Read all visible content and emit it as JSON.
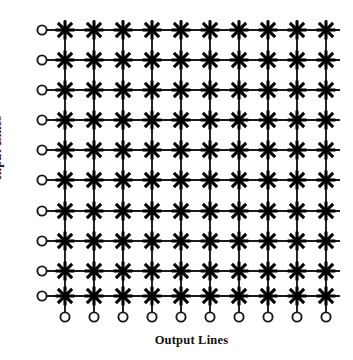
{
  "figure": {
    "type": "crossbar-switch-diagram",
    "input_label": "Input Lines",
    "output_label": "Output Lines",
    "caption_remnant": "",
    "colors": {
      "line": "#1a1a1a",
      "crosspoint": "#000000",
      "terminal_fill": "#ffffff",
      "terminal_stroke": "#1a1a1a",
      "background": "#ffffff"
    }
  },
  "grid": {
    "rows": 10,
    "cols": 10,
    "row_positions": [
      30,
      60,
      90,
      120,
      150,
      180,
      211,
      241,
      271,
      296
    ],
    "col_positions": [
      65,
      94,
      123,
      152,
      181,
      210,
      239,
      268,
      297,
      326
    ],
    "input_terminal_x": 42,
    "output_terminal_y": 317,
    "terminal_radius": 4.6,
    "crosspoint_radius": 9.4,
    "line_width": 1.9,
    "crosspoint_stroke_width": 3.1,
    "row_line_start_x": 47,
    "row_line_end_x": 340,
    "col_line_start_y": 20,
    "col_line_end_y": 312
  },
  "crosspoint": {
    "symbol": "asterisk-8-point",
    "arms": 8,
    "description": "Eight-pointed asterisk marking an on/off crosspoint switch at each row-column intersection"
  },
  "input_lines": [
    {
      "index": 1,
      "label": "input-line-1"
    },
    {
      "index": 2,
      "label": "input-line-2"
    },
    {
      "index": 3,
      "label": "input-line-3"
    },
    {
      "index": 4,
      "label": "input-line-4"
    },
    {
      "index": 5,
      "label": "input-line-5"
    },
    {
      "index": 6,
      "label": "input-line-6"
    },
    {
      "index": 7,
      "label": "input-line-7"
    },
    {
      "index": 8,
      "label": "input-line-8"
    },
    {
      "index": 9,
      "label": "input-line-9"
    },
    {
      "index": 10,
      "label": "input-line-10"
    }
  ],
  "output_lines": [
    {
      "index": 1,
      "label": "output-line-1"
    },
    {
      "index": 2,
      "label": "output-line-2"
    },
    {
      "index": 3,
      "label": "output-line-3"
    },
    {
      "index": 4,
      "label": "output-line-4"
    },
    {
      "index": 5,
      "label": "output-line-5"
    },
    {
      "index": 6,
      "label": "output-line-6"
    },
    {
      "index": 7,
      "label": "output-line-7"
    },
    {
      "index": 8,
      "label": "output-line-8"
    },
    {
      "index": 9,
      "label": "output-line-9"
    },
    {
      "index": 10,
      "label": "output-line-10"
    }
  ]
}
